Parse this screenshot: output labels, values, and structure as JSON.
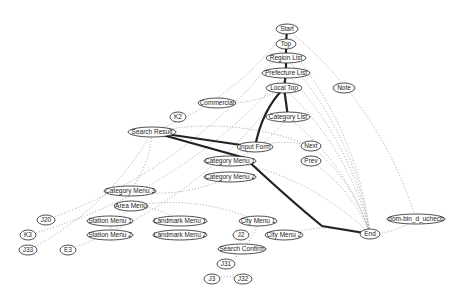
{
  "diagram": {
    "type": "directed-graph",
    "nodes": [
      {
        "id": "start",
        "label": "Start",
        "x": 287,
        "y": 29,
        "rx": 11
      },
      {
        "id": "top",
        "label": "Top",
        "x": 286,
        "y": 44,
        "rx": 10
      },
      {
        "id": "region_list",
        "label": "Region List",
        "x": 286,
        "y": 58,
        "rx": 20
      },
      {
        "id": "prefecture_list",
        "label": "Prefecture List",
        "x": 286,
        "y": 73,
        "rx": 24
      },
      {
        "id": "local_top",
        "label": "Local Top",
        "x": 284,
        "y": 88,
        "rx": 18
      },
      {
        "id": "note",
        "label": "Note",
        "x": 344,
        "y": 88,
        "rx": 11
      },
      {
        "id": "commercial",
        "label": "Commercial",
        "x": 217,
        "y": 103,
        "rx": 19
      },
      {
        "id": "k2",
        "label": "K2",
        "x": 178,
        "y": 117,
        "rx": 8
      },
      {
        "id": "category_list",
        "label": "Category List",
        "x": 288,
        "y": 117,
        "rx": 22
      },
      {
        "id": "search_result",
        "label": "Search Result",
        "x": 152,
        "y": 132,
        "rx": 24
      },
      {
        "id": "input_form",
        "label": "Input Form",
        "x": 255,
        "y": 147,
        "rx": 18
      },
      {
        "id": "next",
        "label": "Next",
        "x": 311,
        "y": 146,
        "rx": 10
      },
      {
        "id": "prev",
        "label": "Prev",
        "x": 311,
        "y": 161,
        "rx": 10
      },
      {
        "id": "category_menu_1",
        "label": "Category Menu 1",
        "x": 230,
        "y": 161,
        "rx": 26
      },
      {
        "id": "category_menu_2",
        "label": "Category Menu 2",
        "x": 230,
        "y": 177,
        "rx": 26
      },
      {
        "id": "category_menu_3",
        "label": "Category Menu 3",
        "x": 130,
        "y": 191,
        "rx": 26
      },
      {
        "id": "area_menu",
        "label": "Area Menu",
        "x": 131,
        "y": 206,
        "rx": 17
      },
      {
        "id": "station_menu_1",
        "label": "Station Menu 1",
        "x": 110,
        "y": 221,
        "rx": 23
      },
      {
        "id": "landmark_menu_1",
        "label": "Landmark Menu 1",
        "x": 180,
        "y": 221,
        "rx": 27
      },
      {
        "id": "city_menu_1",
        "label": "City Menu 1",
        "x": 258,
        "y": 221,
        "rx": 19
      },
      {
        "id": "j20",
        "label": "J20",
        "x": 46,
        "y": 220,
        "rx": 9
      },
      {
        "id": "k3",
        "label": "K3",
        "x": 28,
        "y": 235,
        "rx": 8
      },
      {
        "id": "station_menu_2",
        "label": "Station Menu 2",
        "x": 110,
        "y": 235,
        "rx": 23
      },
      {
        "id": "landmark_menu_2",
        "label": "Landmark Menu 2",
        "x": 180,
        "y": 235,
        "rx": 27
      },
      {
        "id": "j2",
        "label": "J2",
        "x": 241,
        "y": 235,
        "rx": 8
      },
      {
        "id": "city_menu_2",
        "label": "City Menu 2",
        "x": 284,
        "y": 235,
        "rx": 19
      },
      {
        "id": "end",
        "label": "End",
        "x": 370,
        "y": 234,
        "rx": 10
      },
      {
        "id": "dom_bin",
        "label": "dom-bin_d_uchecb",
        "x": 416,
        "y": 219,
        "rx": 29
      },
      {
        "id": "j33",
        "label": "J33",
        "x": 28,
        "y": 250,
        "rx": 9
      },
      {
        "id": "e3",
        "label": "E3",
        "x": 68,
        "y": 250,
        "rx": 8
      },
      {
        "id": "search_confirm",
        "label": "Search Confirm",
        "x": 242,
        "y": 249,
        "rx": 24
      },
      {
        "id": "j31",
        "label": "J31",
        "x": 226,
        "y": 264,
        "rx": 9
      },
      {
        "id": "j3",
        "label": "J3",
        "x": 212,
        "y": 279,
        "rx": 8
      },
      {
        "id": "j32",
        "label": "J32",
        "x": 243,
        "y": 279,
        "rx": 9
      }
    ],
    "thick_edges": [
      {
        "from": "start",
        "to": "top"
      },
      {
        "from": "top",
        "to": "region_list"
      },
      {
        "from": "region_list",
        "to": "prefecture_list"
      },
      {
        "from": "prefecture_list",
        "to": "local_top"
      },
      {
        "from": "local_top",
        "to": "category_list"
      },
      {
        "from": "local_top",
        "to": "input_form"
      },
      {
        "from": "input_form",
        "to": "search_result"
      },
      {
        "from": "search_result",
        "to": "end"
      }
    ],
    "dotted_edges": [
      {
        "from": "start",
        "to": "search_result"
      },
      {
        "from": "start",
        "to": "dom_bin"
      },
      {
        "from": "top",
        "to": "end"
      },
      {
        "from": "top",
        "to": "j20"
      },
      {
        "from": "region_list",
        "to": "end"
      },
      {
        "from": "prefecture_list",
        "to": "end"
      },
      {
        "from": "prefecture_list",
        "to": "k3"
      },
      {
        "from": "local_top",
        "to": "end"
      },
      {
        "from": "local_top",
        "to": "commercial"
      },
      {
        "from": "local_top",
        "to": "e3"
      },
      {
        "from": "category_list",
        "to": "end"
      },
      {
        "from": "category_list",
        "to": "category_menu_1"
      },
      {
        "from": "search_result",
        "to": "j33"
      },
      {
        "from": "search_result",
        "to": "next"
      },
      {
        "from": "search_result",
        "to": "category_menu_3"
      },
      {
        "from": "input_form",
        "to": "next"
      },
      {
        "from": "next",
        "to": "end"
      },
      {
        "from": "prev",
        "to": "end"
      },
      {
        "from": "category_menu_1",
        "to": "end"
      },
      {
        "from": "category_menu_2",
        "to": "category_menu_3"
      },
      {
        "from": "area_menu",
        "to": "station_menu_1"
      },
      {
        "from": "area_menu",
        "to": "landmark_menu_1"
      },
      {
        "from": "area_menu",
        "to": "city_menu_1"
      },
      {
        "from": "station_menu_1",
        "to": "station_menu_2"
      },
      {
        "from": "city_menu_1",
        "to": "search_confirm"
      },
      {
        "from": "city_menu_2",
        "to": "end"
      },
      {
        "from": "dom_bin",
        "to": "end"
      },
      {
        "from": "search_confirm",
        "to": "j31"
      },
      {
        "from": "j3",
        "to": "j32"
      }
    ]
  }
}
